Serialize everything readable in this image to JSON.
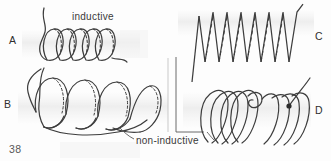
{
  "figure": {
    "page_number": "38",
    "panels": [
      {
        "id": "A",
        "label": "A",
        "caption": "inductive",
        "winding": "single-helix"
      },
      {
        "id": "B",
        "label": "B",
        "caption": "non-inductive",
        "winding": "bifilar-helix"
      },
      {
        "id": "C",
        "label": "C",
        "caption": "",
        "winding": "zigzag-side-view"
      },
      {
        "id": "D",
        "label": "D",
        "caption": "",
        "winding": "folded-back-solenoid"
      }
    ],
    "annotations": {
      "inductive": "inductive",
      "non_inductive": "non-inductive"
    },
    "colors": {
      "ink": "#3a3a3a",
      "paper": "#fdfdfd",
      "shadow": "#ededed",
      "divider": "#c9c9c9"
    }
  }
}
